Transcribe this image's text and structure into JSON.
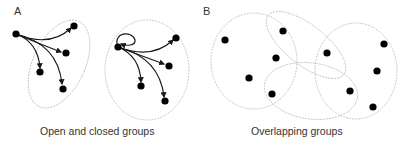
{
  "panels": {
    "a": {
      "letter": "A",
      "caption": "Open and closed groups",
      "groups": [
        {
          "name": "open-group",
          "self_loop": false
        },
        {
          "name": "closed-group",
          "self_loop": true
        }
      ]
    },
    "b": {
      "letter": "B",
      "caption": "Overlapping groups",
      "node_count": 10,
      "group_count": 4
    }
  },
  "colors": {
    "node": "#000000",
    "edge": "#1a1a1a",
    "group_outline": "#bbbbbb",
    "text": "#333333"
  }
}
